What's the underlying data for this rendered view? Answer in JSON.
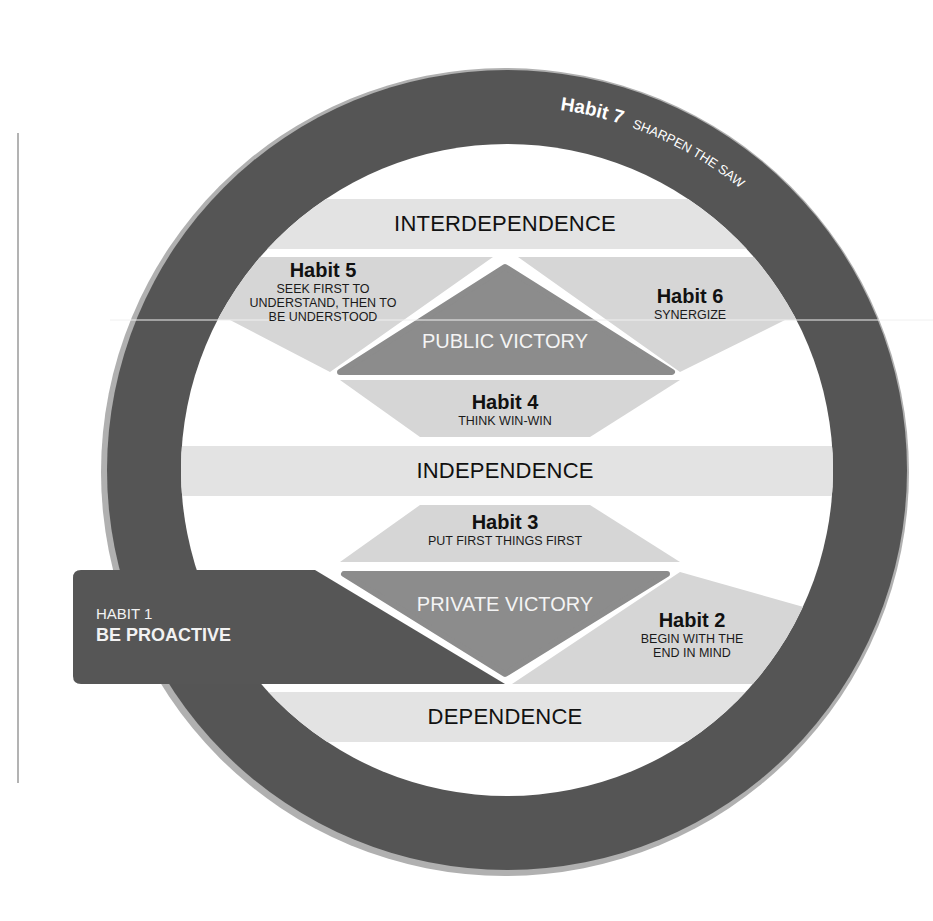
{
  "diagram": {
    "colors": {
      "ring": "#555555",
      "ring_shadow": "#aaaaaa",
      "band": "#e3e3e3",
      "habit_region": "#d6d6d6",
      "victory": "#8c8c8c",
      "habit1_box": "#555555",
      "background": "#ffffff"
    },
    "ring": {
      "habit_label": "Habit 7",
      "habit_desc": "SHARPEN THE SAW"
    },
    "bands": {
      "interdependence": "INTERDEPENDENCE",
      "independence": "INDEPENDENCE",
      "dependence": "DEPENDENCE"
    },
    "victories": {
      "public": "PUBLIC VICTORY",
      "private": "PRIVATE VICTORY"
    },
    "habits": {
      "h1": {
        "title": "HABIT 1",
        "desc": "BE PROACTIVE"
      },
      "h2": {
        "title": "Habit 2",
        "desc_line1": "BEGIN WITH THE",
        "desc_line2": "END IN MIND"
      },
      "h3": {
        "title": "Habit 3",
        "desc": "PUT FIRST THINGS FIRST"
      },
      "h4": {
        "title": "Habit 4",
        "desc": "THINK WIN-WIN"
      },
      "h5": {
        "title": "Habit 5",
        "desc_line1": "SEEK FIRST TO",
        "desc_line2": "UNDERSTAND, THEN TO",
        "desc_line3": "BE UNDERSTOOD"
      },
      "h6": {
        "title": "Habit 6",
        "desc": "SYNERGIZE"
      }
    }
  }
}
